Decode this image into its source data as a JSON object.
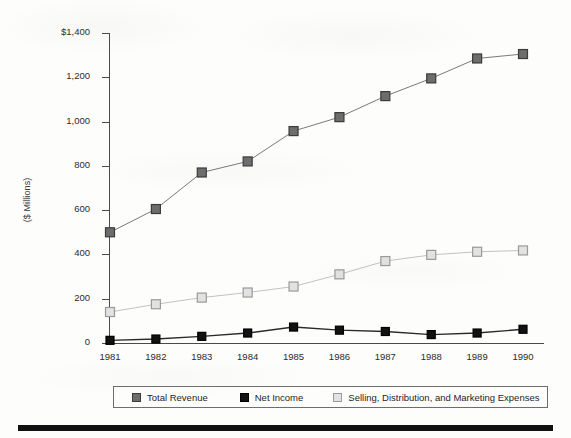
{
  "chart_data": {
    "type": "line",
    "title": "",
    "subtitle": "",
    "xlabel": "",
    "ylabel": "($ Millions)",
    "categories": [
      "1981",
      "1982",
      "1983",
      "1984",
      "1985",
      "1986",
      "1987",
      "1988",
      "1989",
      "1990"
    ],
    "ylim": [
      0,
      1400
    ],
    "ytick_values": [
      0,
      200,
      400,
      600,
      800,
      1000,
      1200,
      1400
    ],
    "ytick_labels": [
      "0",
      "200",
      "400",
      "600",
      "800",
      "1,000",
      "1,200",
      "$1,400"
    ],
    "grid": false,
    "legend_position": "bottom",
    "series": [
      {
        "name": "Total Revenue",
        "marker": "square",
        "color": "#6d6d6d",
        "edge_color": "#3b3b3b",
        "line_color": "#7a7a7a",
        "values": [
          500,
          605,
          770,
          820,
          957,
          1020,
          1115,
          1195,
          1285,
          1305
        ]
      },
      {
        "name": "Net Income",
        "marker": "square",
        "color": "#121212",
        "edge_color": "#000000",
        "line_color": "#2a2a2a",
        "values": [
          12,
          18,
          30,
          45,
          72,
          58,
          52,
          38,
          45,
          62
        ]
      },
      {
        "name": "Selling, Distribution, and Marketing Expenses",
        "marker": "square",
        "color": "#e2e2e2",
        "edge_color": "#9a9a9a",
        "line_color": "#c2c2c2",
        "values": [
          140,
          175,
          205,
          228,
          255,
          310,
          370,
          398,
          412,
          418
        ]
      }
    ]
  },
  "legend": {
    "items": [
      {
        "label": "Total Revenue"
      },
      {
        "label": "Net Income"
      },
      {
        "label": "Selling, Distribution, and Marketing Expenses"
      }
    ]
  }
}
